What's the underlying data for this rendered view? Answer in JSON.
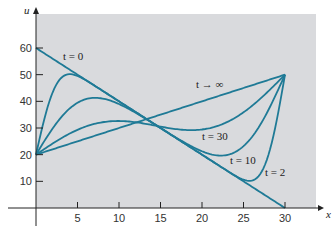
{
  "chart_data": {
    "type": "line",
    "title": "",
    "xlabel": "x",
    "ylabel": "u",
    "xlim": [
      0,
      30
    ],
    "ylim": [
      0,
      60
    ],
    "x_ticks": [
      5,
      10,
      15,
      20,
      25,
      30
    ],
    "y_ticks": [
      10,
      20,
      30,
      40,
      50,
      60
    ],
    "grid": false,
    "model": {
      "description": "Heat conduction in rod: u(0,t)=20, u(30,t)=50, u(x,0)=60-2x",
      "length": 30,
      "left_temp": 20,
      "right_temp": 50,
      "initial_intercept": 60,
      "initial_slope": -2,
      "diffusivity": 1
    },
    "series": [
      {
        "name": "t = 0",
        "t": 0,
        "label": "t = 0"
      },
      {
        "name": "t = 2",
        "t": 2,
        "label": "t = 2"
      },
      {
        "name": "t = 10",
        "t": 10,
        "label": "t = 10"
      },
      {
        "name": "t = 30",
        "t": 30,
        "label": "t = 30"
      },
      {
        "name": "t → ∞",
        "t": "inf",
        "label": "t → ∞"
      }
    ],
    "line_color": "#1f7a96",
    "plot_background": "#d9dadd"
  }
}
